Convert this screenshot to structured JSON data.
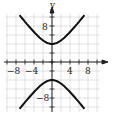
{
  "chart_data": {
    "type": "line",
    "title": "",
    "xlabel": "",
    "ylabel": "y",
    "xlim": [
      -11,
      11
    ],
    "ylim": [
      -12,
      12
    ],
    "grid": true,
    "x_tick_labels": [
      "-8",
      "-4",
      "4",
      "8"
    ],
    "y_tick_labels": [
      "8",
      "-8"
    ],
    "series": [
      {
        "name": "upper branch",
        "equation": "y^2/16 - x^2/9 = 1, y>0",
        "points": [
          [
            -7,
            10.1
          ],
          [
            -4,
            6.7
          ],
          [
            -2,
            4.8
          ],
          [
            0,
            4
          ],
          [
            2,
            4.8
          ],
          [
            4,
            6.7
          ],
          [
            7,
            10.1
          ]
        ]
      },
      {
        "name": "lower branch",
        "equation": "y^2/16 - x^2/9 = 1, y<0",
        "points": [
          [
            -7,
            -10.1
          ],
          [
            -4,
            -6.7
          ],
          [
            -2,
            -4.8
          ],
          [
            0,
            -4
          ],
          [
            2,
            -4.8
          ],
          [
            4,
            -6.7
          ],
          [
            7,
            -10.1
          ]
        ]
      }
    ]
  },
  "labels": {
    "y_axis": "y",
    "x_neg8": "−8",
    "x_neg4": "−4",
    "x_4": "4",
    "x_8": "8",
    "y_8": "8",
    "y_neg8": "−8"
  }
}
